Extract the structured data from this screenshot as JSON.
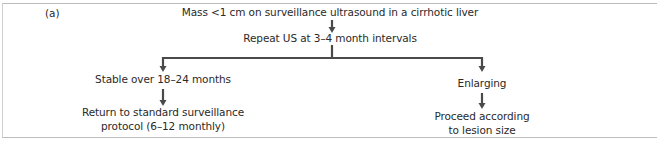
{
  "figure": {
    "panel_label": "(a)",
    "nodes": {
      "start": "Mass <1 cm on surveillance ultrasound in a cirrhotic liver",
      "repeat": "Repeat US at 3–4 month intervals",
      "stable": "Stable over 18–24 months",
      "stable_outcome_line1": "Return to standard surveillance",
      "stable_outcome_line2": "protocol (6–12 monthly)",
      "enlarging": "Enlarging",
      "enlarging_outcome_line1": "Proceed according",
      "enlarging_outcome_line2": "to lesion size"
    },
    "colors": {
      "arrow": "#4a4a4a",
      "text": "#2a2a2a",
      "frame": "#bdbdbd"
    }
  }
}
